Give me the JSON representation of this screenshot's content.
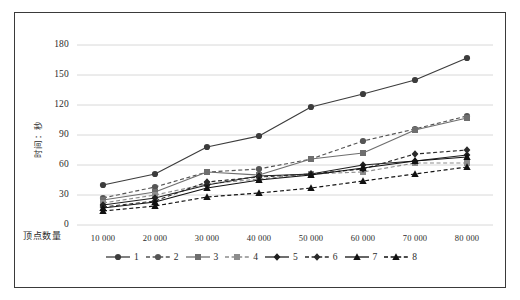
{
  "chart_data": {
    "type": "line",
    "title": "",
    "xlabel": "顶点数量",
    "ylabel": "时间：秒",
    "x": [
      10000,
      20000,
      30000,
      40000,
      50000,
      60000,
      70000,
      80000
    ],
    "xtick_labels": [
      "10 000",
      "20 000",
      "30 000",
      "40 000",
      "50 000",
      "60 000",
      "70 000",
      "80 000"
    ],
    "ytick_labels": [
      "0",
      "30",
      "60",
      "90",
      "120",
      "150",
      "180"
    ],
    "ytick_values": [
      0,
      30,
      60,
      90,
      120,
      150,
      180
    ],
    "ylim": [
      0,
      190
    ],
    "grid": "horizontal",
    "legend_position": "bottom",
    "series": [
      {
        "name": "1",
        "values": [
          40,
          51,
          78,
          89,
          118,
          131,
          145,
          167
        ],
        "marker": "circle",
        "dash": "solid",
        "color": "#3c3c3c"
      },
      {
        "name": "2",
        "values": [
          27,
          38,
          53,
          56,
          66,
          84,
          96,
          109
        ],
        "marker": "circle",
        "dash": "dashed",
        "color": "#555555"
      },
      {
        "name": "3",
        "values": [
          25,
          33,
          53,
          50,
          66,
          72,
          95,
          107
        ],
        "marker": "square",
        "dash": "solid",
        "color": "#6e6e6e"
      },
      {
        "name": "4",
        "values": [
          22,
          30,
          41,
          46,
          51,
          53,
          62,
          62
        ],
        "marker": "square",
        "dash": "dashed",
        "color": "#8d8d8d"
      },
      {
        "name": "5",
        "values": [
          20,
          27,
          40,
          49,
          51,
          60,
          64,
          70
        ],
        "marker": "diamond",
        "dash": "solid",
        "color": "#1f1f1f"
      },
      {
        "name": "6",
        "values": [
          18,
          24,
          43,
          48,
          51,
          56,
          71,
          75
        ],
        "marker": "diamond",
        "dash": "dashed",
        "color": "#2a2a2a"
      },
      {
        "name": "7",
        "values": [
          17,
          23,
          37,
          45,
          50,
          57,
          64,
          68
        ],
        "marker": "triangle",
        "dash": "solid",
        "color": "#111111"
      },
      {
        "name": "8",
        "values": [
          14,
          19,
          28,
          32,
          37,
          44,
          51,
          58
        ],
        "marker": "triangle",
        "dash": "dashed",
        "color": "#111111"
      }
    ]
  },
  "legend": {
    "items": [
      {
        "label": "1"
      },
      {
        "label": "2"
      },
      {
        "label": "3"
      },
      {
        "label": "4"
      },
      {
        "label": "5"
      },
      {
        "label": "6"
      },
      {
        "label": "7"
      },
      {
        "label": "8"
      }
    ]
  }
}
